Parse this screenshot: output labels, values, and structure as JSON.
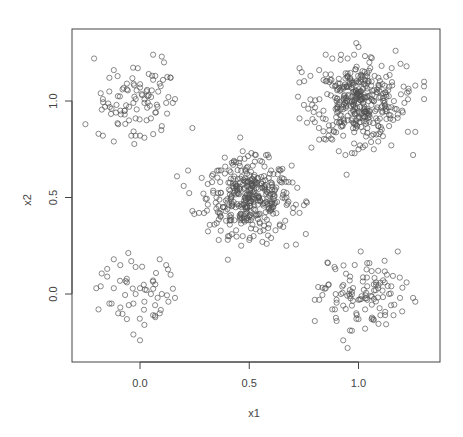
{
  "chart_data": {
    "type": "scatter",
    "title": "",
    "xlabel": "x1",
    "ylabel": "x2",
    "xlim": [
      -0.3,
      1.38
    ],
    "ylim": [
      -0.35,
      1.38
    ],
    "xticks": [
      0.0,
      0.5,
      1.0
    ],
    "yticks": [
      0.0,
      0.5,
      1.0
    ],
    "xtick_labels": [
      "0.0",
      "0.5",
      "1.0"
    ],
    "ytick_labels": [
      "0.0",
      "0.5",
      "1.0"
    ],
    "grid": false,
    "legend": null,
    "marker": "open-circle",
    "marker_color": "#505050",
    "series": [
      {
        "name": "cluster-top-left",
        "center": [
          0.0,
          1.0
        ],
        "sd": 0.1,
        "n": 100,
        "x": [
          -0.21,
          0.06,
          0.1,
          0.11,
          -0.12,
          0.07,
          -0.01,
          0.04,
          -0.14,
          -0.06,
          0.14,
          -0.18,
          -0.17,
          0.0,
          0.03,
          0.09,
          -0.08,
          0.16,
          0.15,
          0.13,
          -0.09,
          -0.05,
          0.02,
          0.08,
          -0.16,
          -0.25,
          0.24,
          0.1,
          -0.19,
          -0.17,
          -0.12,
          -0.04,
          -0.02,
          0.0,
          0.02,
          -0.1,
          -0.02,
          0.05,
          0.07,
          -0.07,
          -0.03,
          0.01,
          0.06,
          0.12,
          -0.13,
          -0.11,
          0.04,
          -0.06,
          0.03
        ],
        "y": [
          1.22,
          1.24,
          1.23,
          1.2,
          1.16,
          1.13,
          1.17,
          1.14,
          1.12,
          1.09,
          1.12,
          1.04,
          1.01,
          1.07,
          1.05,
          1.09,
          1.06,
          1.01,
          0.99,
          1.02,
          0.95,
          0.97,
          0.99,
          0.97,
          0.97,
          0.88,
          0.86,
          0.87,
          0.83,
          0.82,
          0.79,
          0.82,
          0.82,
          0.82,
          0.81,
          0.88,
          0.91,
          0.91,
          0.94,
          0.93,
          0.99,
          1.03,
          1.11,
          0.99,
          0.96,
          0.94,
          1.03,
          1.06,
          0.9
        ]
      },
      {
        "name": "cluster-bottom-left",
        "center": [
          0.0,
          0.0
        ],
        "sd": 0.1,
        "n": 60,
        "x": [
          -0.12,
          -0.04,
          0.09,
          -0.15,
          -0.09,
          -0.02,
          0.12,
          0.14,
          -0.18,
          -0.15,
          -0.06,
          0.03,
          0.06,
          0.07,
          0.05,
          0.1,
          -0.19,
          -0.13,
          -0.14,
          -0.09,
          -0.03,
          0.02,
          0.07,
          0.16,
          0.13,
          -0.1,
          -0.06,
          -0.03,
          0.0,
          0.02,
          0.09,
          0.06,
          -0.02,
          0.0,
          -0.12,
          -0.2
        ],
        "y": [
          0.18,
          0.17,
          0.18,
          0.13,
          0.15,
          0.14,
          0.15,
          0.1,
          0.04,
          0.09,
          0.06,
          0.02,
          0.07,
          0.05,
          0.0,
          0.0,
          -0.08,
          -0.05,
          -0.05,
          -0.07,
          -0.05,
          -0.04,
          -0.12,
          -0.02,
          -0.04,
          -0.1,
          -0.13,
          -0.21,
          -0.24,
          -0.16,
          -0.1,
          -0.11,
          0.0,
          0.03,
          0.03,
          0.03
        ]
      },
      {
        "name": "cluster-center",
        "center": [
          0.5,
          0.5
        ],
        "sd": 0.1,
        "n": 400,
        "x": [
          0.47,
          0.51,
          0.53,
          0.55,
          0.43,
          0.42,
          0.39,
          0.36,
          0.22,
          0.2,
          0.24,
          0.27,
          0.29,
          0.31,
          0.33,
          0.35,
          0.38,
          0.41,
          0.44,
          0.47,
          0.5,
          0.52,
          0.56,
          0.58,
          0.6,
          0.62,
          0.64,
          0.67,
          0.7,
          0.73,
          0.75,
          0.76,
          0.72,
          0.68,
          0.65,
          0.63,
          0.6,
          0.57,
          0.54,
          0.51,
          0.48,
          0.45,
          0.42,
          0.4,
          0.37,
          0.34,
          0.36,
          0.42,
          0.5,
          0.55,
          0.61,
          0.67,
          0.44,
          0.48,
          0.52,
          0.58
        ],
        "y": [
          0.74,
          0.73,
          0.72,
          0.69,
          0.69,
          0.68,
          0.66,
          0.64,
          0.64,
          0.56,
          0.43,
          0.42,
          0.52,
          0.57,
          0.58,
          0.5,
          0.45,
          0.38,
          0.33,
          0.3,
          0.28,
          0.3,
          0.27,
          0.26,
          0.29,
          0.33,
          0.36,
          0.25,
          0.42,
          0.42,
          0.46,
          0.48,
          0.55,
          0.58,
          0.6,
          0.62,
          0.64,
          0.66,
          0.6,
          0.57,
          0.55,
          0.52,
          0.47,
          0.44,
          0.4,
          0.36,
          0.28,
          0.31,
          0.4,
          0.48,
          0.45,
          0.5,
          0.56,
          0.5,
          0.44,
          0.53
        ]
      },
      {
        "name": "cluster-top-right",
        "center": [
          1.0,
          1.0
        ],
        "sd": 0.1,
        "n": 400,
        "x": [
          0.99,
          1.0,
          0.98,
          1.17,
          0.85,
          0.88,
          0.92,
          0.95,
          1.05,
          0.73,
          0.74,
          0.78,
          0.82,
          1.22,
          1.26,
          1.3,
          1.3,
          1.23,
          1.21,
          1.2,
          1.18,
          1.14,
          1.1,
          1.06,
          1.03,
          1.0,
          0.97,
          0.94,
          0.91,
          0.88,
          0.85,
          0.82,
          0.8,
          0.77,
          0.73,
          0.75,
          0.84,
          0.93,
          0.95,
          0.98,
          1.02,
          1.07,
          1.09,
          1.15,
          1.25,
          1.26,
          0.97,
          1.01,
          1.04,
          0.96,
          1.1,
          0.9,
          1.12,
          0.88
        ],
        "y": [
          1.3,
          1.28,
          1.24,
          1.26,
          1.24,
          1.22,
          1.24,
          1.22,
          1.2,
          1.17,
          1.15,
          1.13,
          1.16,
          1.18,
          1.08,
          1.1,
          1.01,
          1.05,
          0.99,
          0.95,
          0.93,
          0.87,
          0.84,
          0.82,
          0.77,
          0.75,
          0.73,
          0.72,
          0.74,
          0.8,
          0.8,
          0.8,
          0.89,
          0.96,
          0.91,
          0.98,
          0.95,
          0.82,
          0.9,
          0.78,
          0.76,
          0.75,
          0.79,
          0.77,
          0.72,
          0.84,
          1.0,
          1.05,
          0.95,
          1.1,
          1.02,
          1.0,
          1.08,
          1.08
        ]
      },
      {
        "name": "cluster-bottom-right",
        "center": [
          1.0,
          0.0
        ],
        "sd": 0.1,
        "n": 120,
        "x": [
          1.01,
          1.18,
          0.86,
          0.89,
          1.04,
          1.05,
          1.09,
          1.13,
          1.12,
          0.85,
          0.82,
          0.8,
          0.8,
          0.9,
          0.93,
          0.96,
          1.0,
          1.04,
          1.08,
          1.15,
          1.19,
          1.22,
          1.25,
          1.26,
          1.2,
          1.16,
          1.1,
          1.06,
          1.03,
          1.0,
          0.97,
          0.95,
          0.93,
          0.9,
          0.88,
          0.97,
          1.03,
          0.92,
          0.96,
          1.04,
          1.07,
          0.99,
          1.14,
          1.09
        ],
        "y": [
          0.22,
          0.22,
          0.16,
          0.14,
          0.16,
          0.16,
          0.12,
          0.1,
          0.06,
          0.03,
          -0.03,
          -0.03,
          -0.14,
          -0.03,
          -0.06,
          -0.01,
          -0.03,
          -0.03,
          0.06,
          0.04,
          -0.02,
          0.06,
          -0.02,
          -0.04,
          -0.09,
          -0.11,
          -0.11,
          -0.13,
          -0.18,
          -0.13,
          -0.19,
          -0.28,
          -0.24,
          -0.14,
          -0.08,
          -0.06,
          -0.08,
          0.0,
          0.02,
          0.04,
          0.05,
          -0.1,
          0.0,
          0.03
        ]
      }
    ]
  }
}
